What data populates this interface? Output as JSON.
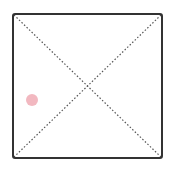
{
  "board": {
    "border_color": "#333333",
    "diagonal_color": "#555555",
    "background": "#ffffff",
    "left": 13,
    "top": 14,
    "right": 162,
    "bottom": 158
  },
  "pieces": [
    {
      "color": "#f2b8c0",
      "cx": 32,
      "cy": 100,
      "r": 6
    }
  ]
}
